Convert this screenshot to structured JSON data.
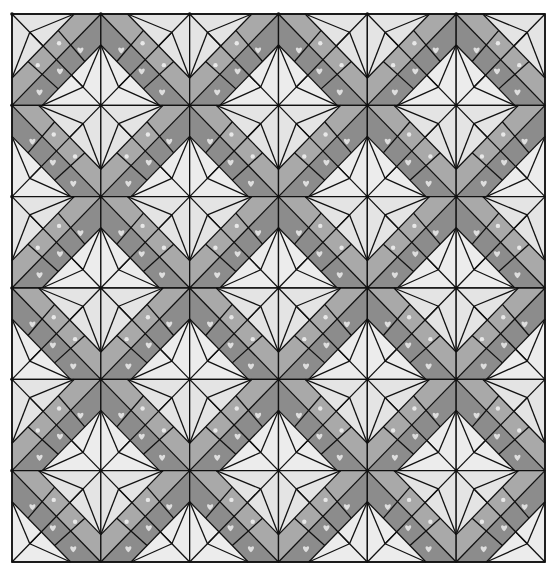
{
  "diagram": {
    "type": "quilt-pattern",
    "title": "",
    "grid": {
      "columns": 6,
      "rows": 6
    },
    "bounds": {
      "left": 12,
      "top": 14,
      "right": 545,
      "bottom": 562
    },
    "colors": {
      "background": "#ffffff",
      "light_fabric": "#e4e4e4",
      "light_fabric_alt": "#ececec",
      "medium_floral": "#a9a9a9",
      "dark_heart": "#8c8c8c",
      "heart_motif": "#dedede",
      "seam_line": "#111111"
    },
    "block": {
      "description": "String-pieced diagonal band block with crossing diagonal and light corner kites",
      "orientation_rule": "(col+row) even -> band runs bottom-left to top-right; odd -> top-left to bottom-right",
      "strips": [
        "medium_floral",
        "dark_heart"
      ]
    }
  }
}
